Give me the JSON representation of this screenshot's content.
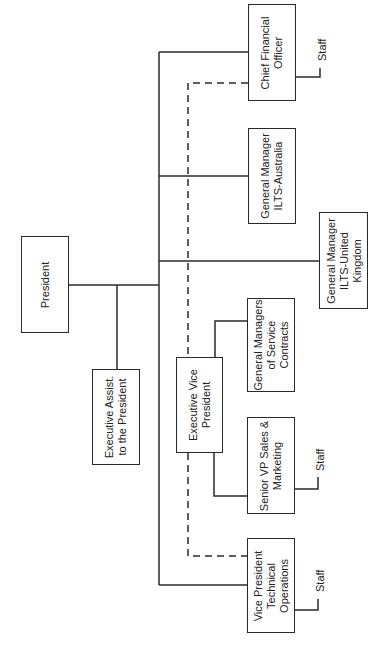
{
  "chart": {
    "orientation": "rotated-90-ccw",
    "nodes": {
      "president": "President",
      "exec_assist": "Executive Assist.\nto the President",
      "evp": "Executive Vice\nPresident",
      "cfo": "Chief Financial\nOfficer",
      "gm_australia": "General Manager\nILTS-Australia",
      "gm_uk": "General Manager\nILTS-United\nKingdom",
      "gm_service": "General Managers\nof Service\nContracts",
      "svp_sales": "Senior VP Sales &\nMarketing",
      "vp_tech": "Vice President\nTechnical\nOperations"
    },
    "staff_label": "Staff",
    "line_color": "#2a2a2a"
  }
}
